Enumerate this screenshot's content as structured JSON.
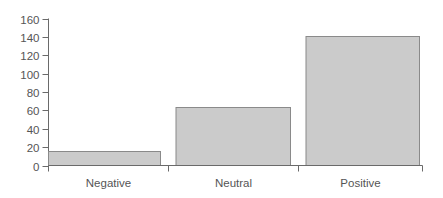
{
  "chart_data": {
    "type": "bar",
    "title": "",
    "xlabel": "",
    "ylabel": "",
    "categories": [
      "Negative",
      "Neutral",
      "Positive"
    ],
    "values": [
      16,
      64,
      141
    ],
    "ylim": [
      0,
      160
    ],
    "yticks": [
      0,
      20,
      40,
      60,
      80,
      100,
      120,
      140,
      160
    ],
    "grid": false,
    "legend": null,
    "colors": {
      "bar_fill": "#cbcbcb",
      "bar_stroke": "#8a8a8a",
      "axis": "#6a6a6a",
      "text": "#555555"
    }
  }
}
